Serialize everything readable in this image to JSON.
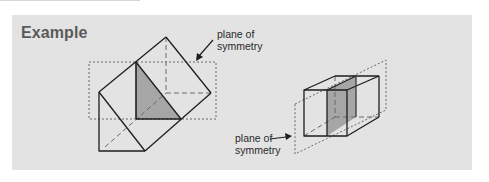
{
  "heading": "Example",
  "figures": [
    {
      "name": "triangular-prism",
      "label": {
        "line1": "plane of",
        "line2": "symmetry"
      }
    },
    {
      "name": "cuboid",
      "label": {
        "line1": "plane of",
        "line2": "symmetry"
      }
    }
  ],
  "colors": {
    "panel": "#e3e3e3",
    "heading": "#5a5a5a",
    "edge": "#1e1e1e",
    "shade": "#a6a6a6",
    "dash": "#6a6a6a"
  }
}
